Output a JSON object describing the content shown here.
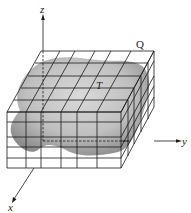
{
  "figure": {
    "type": "3d-region-partition-diagram",
    "labels": {
      "solid": "T",
      "box": "Q",
      "x_axis": "x",
      "y_axis": "y",
      "z_axis": "z"
    },
    "colors": {
      "grid": "#1a1a1a",
      "solid_fill": "#a8a8a8",
      "solid_shadow": "#7a7a7a",
      "background": "#ffffff"
    },
    "grid": {
      "front_columns": 6,
      "front_rows": 5,
      "depth_divisions": 5
    }
  }
}
